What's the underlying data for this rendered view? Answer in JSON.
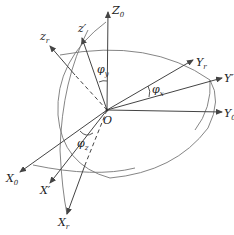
{
  "diagram": {
    "title": "",
    "origin_label": "O",
    "axes": [
      {
        "id": "Z0",
        "base": "Z",
        "sub": "0",
        "sup": ""
      },
      {
        "id": "z_prime",
        "base": "z",
        "sub": "",
        "sup": "′"
      },
      {
        "id": "zr",
        "base": "z",
        "sub": "r",
        "sup": ""
      },
      {
        "id": "Yr",
        "base": "Y",
        "sub": "r",
        "sup": ""
      },
      {
        "id": "Y_prime",
        "base": "Y",
        "sub": "",
        "sup": "′"
      },
      {
        "id": "Y0",
        "base": "Y",
        "sub": "0",
        "sup": ""
      },
      {
        "id": "X0",
        "base": "X",
        "sub": "0",
        "sup": ""
      },
      {
        "id": "X_prime",
        "base": "X",
        "sub": "",
        "sup": "′"
      },
      {
        "id": "Xr",
        "base": "X",
        "sub": "r",
        "sup": ""
      }
    ],
    "angles": [
      {
        "id": "phi_y",
        "base": "φ",
        "sub": "y"
      },
      {
        "id": "phi_x",
        "base": "φ",
        "sub": "x"
      },
      {
        "id": "phi_z",
        "base": "φ",
        "sub": "z"
      }
    ],
    "colors": {
      "line": "#555555",
      "text": "#222222",
      "background": "#ffffff"
    }
  }
}
